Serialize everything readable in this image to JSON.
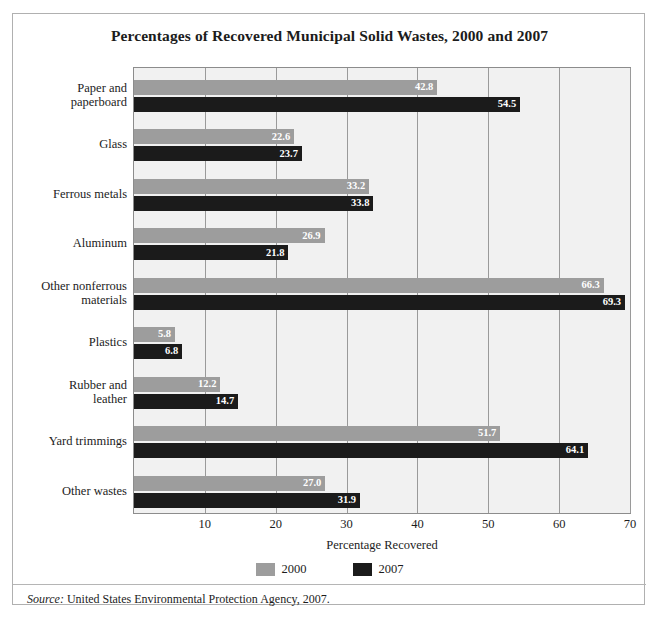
{
  "figure": {
    "title": "Percentages of Recovered Municipal Solid Wastes, 2000 and 2007",
    "source_word": "Source:",
    "source_text": " United States Environmental Protection Agency, 2007.",
    "page_header_faint": ""
  },
  "axis": {
    "x_label": "Percentage Recovered",
    "x_ticks": [
      "10",
      "20",
      "30",
      "40",
      "50",
      "60",
      "70"
    ]
  },
  "legend": {
    "items": [
      {
        "label": "2000",
        "color": "#9d9d9d"
      },
      {
        "label": "2007",
        "color": "#1b1b1b"
      }
    ]
  },
  "colors": {
    "series_2000": "#9d9d9d",
    "series_2007": "#1b1b1b",
    "plot_background": "#f1f1f1",
    "gridline": "#9a9a9a",
    "frame_border": "#b0b0b0",
    "text": "#1c1c1c",
    "value_label": "#ffffff"
  },
  "chart_data": {
    "type": "bar",
    "orientation": "horizontal",
    "title": "Percentages of Recovered Municipal Solid Wastes, 2000 and 2007",
    "xlabel": "Percentage Recovered",
    "ylabel": "",
    "xlim": [
      0,
      70
    ],
    "xticks": [
      10,
      20,
      30,
      40,
      50,
      60,
      70
    ],
    "grid": true,
    "legend_position": "bottom",
    "categories": [
      "Paper and paperboard",
      "Glass",
      "Ferrous metals",
      "Aluminum",
      "Other nonferrous materials",
      "Plastics",
      "Rubber and leather",
      "Yard trimmings",
      "Other wastes"
    ],
    "category_lines": [
      [
        "Paper and",
        "paperboard"
      ],
      [
        "Glass"
      ],
      [
        "Ferrous metals"
      ],
      [
        "Aluminum"
      ],
      [
        "Other nonferrous",
        "materials"
      ],
      [
        "Plastics"
      ],
      [
        "Rubber and",
        "leather"
      ],
      [
        "Yard trimmings"
      ],
      [
        "Other wastes"
      ]
    ],
    "series": [
      {
        "name": "2000",
        "color": "#9d9d9d",
        "values": [
          42.8,
          22.6,
          33.2,
          26.9,
          66.3,
          5.8,
          12.2,
          51.7,
          27.0
        ],
        "labels": [
          "42.8",
          "22.6",
          "33.2",
          "26.9",
          "66.3",
          "5.8",
          "12.2",
          "51.7",
          "27.0"
        ]
      },
      {
        "name": "2007",
        "color": "#1b1b1b",
        "values": [
          54.5,
          23.7,
          33.8,
          21.8,
          69.3,
          6.8,
          14.7,
          64.1,
          31.9
        ],
        "labels": [
          "54.5",
          "23.7",
          "33.8",
          "21.8",
          "69.3",
          "6.8",
          "14.7",
          "64.1",
          "31.9"
        ]
      }
    ],
    "source": "Source: United States Environmental Protection Agency, 2007."
  }
}
